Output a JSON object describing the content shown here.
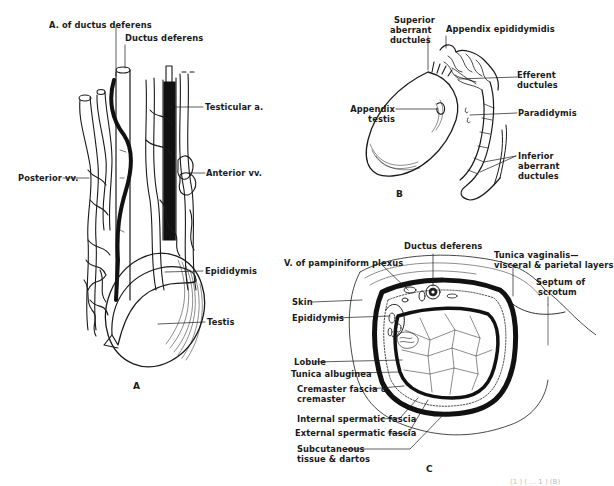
{
  "figure": {
    "panels": [
      {
        "id": "A",
        "caption": "A",
        "labels": {
          "a_ductus_deferens": "A. of ductus deferens",
          "ductus_deferens": "Ductus deferens",
          "testicular_a": "Testicular a.",
          "posterior_vv": "Posterior vv.",
          "anterior_vv": "Anterior vv.",
          "epididymis": "Epididymis",
          "testis": "Testis"
        }
      },
      {
        "id": "B",
        "caption": "B",
        "labels": {
          "superior_aberrant_1": "Superior",
          "superior_aberrant_2": "aberrant",
          "superior_aberrant_3": "ductules",
          "appendix_epididymidis": "Appendix epididymidis",
          "appendix_testis_1": "Appendix",
          "appendix_testis_2": "testis",
          "efferent_1": "Efferent",
          "efferent_2": "ductules",
          "paradidymis": "Paradidymis",
          "inferior_aberrant_1": "Inferior",
          "inferior_aberrant_2": "aberrant",
          "inferior_aberrant_3": "ductules"
        }
      },
      {
        "id": "C",
        "caption": "C",
        "labels": {
          "v_pampiniform": "V. of pampiniform plexus",
          "ductus_deferens": "Ductus deferens",
          "tunica_vaginalis_1": "Tunica vaginalis—",
          "tunica_vaginalis_2": "visceral & parietal layers",
          "septum_1": "Septum of",
          "septum_2": "scrotum",
          "skin": "Skin",
          "epididymis": "Epididymis",
          "lobule": "Lobule",
          "tunica_albuginea": "Tunica albuginea",
          "cremaster_1": "Cremaster fascia &",
          "cremaster_2": "cremaster",
          "internal_spermatic": "Internal spermatic fascia",
          "external_spermatic": "External spermatic fascia",
          "subcutaneous_1": "Subcutaneous",
          "subcutaneous_2": "tissue & dartos"
        }
      }
    ],
    "footer_fragment": "(1 ) ( ... 1 ) (B)"
  }
}
